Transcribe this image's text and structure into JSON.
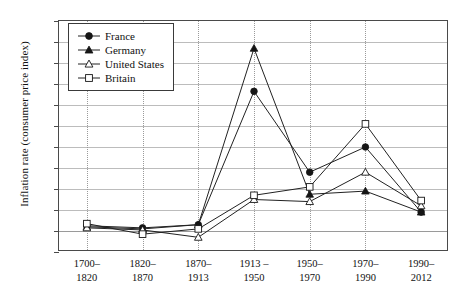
{
  "chart_data": {
    "type": "line",
    "title": "",
    "xlabel": "",
    "ylabel": "Inflation rate (consumer price index)",
    "categories": [
      "1700-\n1820",
      "1820-\n1870",
      "1870-\n1913",
      "1913-\n1950",
      "1950-\n1970",
      "1970-\n1990",
      "1990-\n2012"
    ],
    "category_labels": [
      {
        "top": "1700–",
        "bottom": "1820"
      },
      {
        "top": "1820–",
        "bottom": "1870"
      },
      {
        "top": "1870–",
        "bottom": "1913"
      },
      {
        "top": "1913 –",
        "bottom": "1950"
      },
      {
        "top": "1950–",
        "bottom": "1970"
      },
      {
        "top": "1970–",
        "bottom": "1990"
      },
      {
        "top": "1990–",
        "bottom": "2012"
      }
    ],
    "ylim": [
      -2,
      20
    ],
    "ytick_labels": [
      "20%",
      "18%",
      "16%",
      "14%",
      "12%",
      "10%",
      "8%",
      "6%",
      "4%",
      "2%",
      "0%",
      "-2%"
    ],
    "ytick_values": [
      20,
      18,
      16,
      14,
      12,
      10,
      8,
      6,
      4,
      2,
      0,
      -2
    ],
    "grid": true,
    "legend_position": "top-left",
    "series": [
      {
        "name": "France",
        "marker": "filled-circle",
        "values": [
          0.5,
          0.3,
          0.6,
          13.3,
          5.6,
          8.0,
          1.8
        ]
      },
      {
        "name": "Germany",
        "marker": "filled-triangle",
        "values": [
          0.4,
          0.2,
          0.6,
          17.4,
          3.5,
          3.8,
          1.8
        ]
      },
      {
        "name": "United States",
        "marker": "open-triangle",
        "values": [
          0.3,
          0.1,
          -0.6,
          3.0,
          2.8,
          5.6,
          2.4
        ]
      },
      {
        "name": "Britain",
        "marker": "open-square",
        "values": [
          0.7,
          -0.3,
          0.2,
          3.4,
          4.2,
          10.2,
          2.9
        ]
      }
    ]
  },
  "legend": {
    "items": [
      {
        "label": "France"
      },
      {
        "label": "Germany"
      },
      {
        "label": "United States"
      },
      {
        "label": "Britain"
      }
    ]
  },
  "colors": {
    "line": "#222222",
    "grid": "#bcbcbc",
    "axis": "#4a4a4a"
  }
}
